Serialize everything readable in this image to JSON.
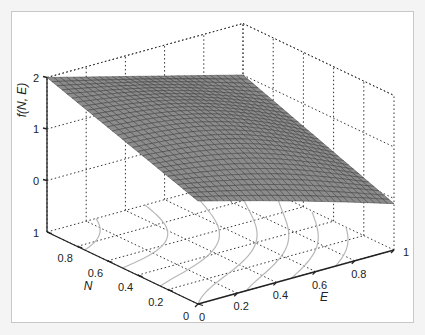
{
  "chart_data": {
    "type": "surface3d",
    "title": "",
    "xlabel": "E",
    "ylabel": "N",
    "zlabel": "f(N, E)",
    "x_ticks": [
      "0",
      "0.2",
      "0.4",
      "0.6",
      "0.8",
      "1"
    ],
    "y_ticks": [
      "0",
      "0.2",
      "0.4",
      "0.6",
      "0.8",
      "1"
    ],
    "z_ticks": [
      "0",
      "1",
      "2"
    ],
    "xlim": [
      0,
      1
    ],
    "ylim": [
      0,
      1
    ],
    "zlim": [
      -1,
      2
    ],
    "grid": true,
    "surface_corners": {
      "N0_E0": 1.0,
      "N1_E0": 2.0,
      "N1_E1": 1.0,
      "N0_E1": 0.0
    },
    "mesh_resolution": 30,
    "floor_contours": true,
    "surface_color": "#8c8c8c",
    "mesh_line_color": "#3a3a3a",
    "contour_color": "#b8b8b8"
  }
}
